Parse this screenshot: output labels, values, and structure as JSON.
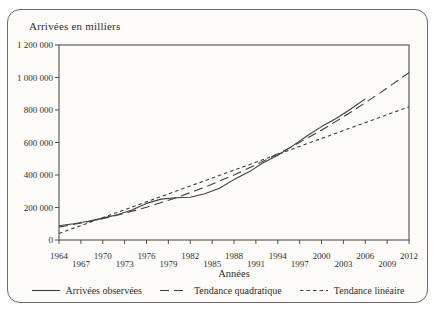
{
  "panel": {
    "title": "Arrivées en milliers"
  },
  "colors": {
    "line": "#3f3f3f",
    "frame": "#4f4f4f",
    "text": "#2f2f2f",
    "panel_border": "#6b6b6b",
    "panel_bg": "#fdfcf9"
  },
  "chart_data": {
    "type": "line",
    "title": "Arrivées en milliers",
    "xlabel": "Années",
    "ylabel": "",
    "xlim": [
      1964,
      2012
    ],
    "ylim": [
      0,
      1200000
    ],
    "grid": false,
    "legend_position": "bottom",
    "x_ticks": [
      1964,
      1967,
      1970,
      1973,
      1976,
      1979,
      1982,
      1985,
      1988,
      1991,
      1994,
      1997,
      2000,
      2003,
      2006,
      2009,
      2012
    ],
    "y_ticks": [
      0,
      200000,
      400000,
      600000,
      800000,
      1000000,
      1200000
    ],
    "y_tick_labels": [
      "0",
      "200 000",
      "400 000",
      "600 000",
      "800 000",
      "1 000 000",
      "1 200 000"
    ],
    "series": [
      {
        "name": "Arrivées observées",
        "style": "solid",
        "x": [
          1964,
          1966,
          1968,
          1970,
          1972,
          1974,
          1976,
          1978,
          1980,
          1982,
          1984,
          1986,
          1988,
          1990,
          1992,
          1994,
          1996,
          1998,
          2000,
          2002,
          2004,
          2006
        ],
        "y": [
          88000,
          100000,
          115000,
          135000,
          155000,
          185000,
          225000,
          252000,
          260000,
          263000,
          285000,
          318000,
          372000,
          418000,
          475000,
          522000,
          578000,
          640000,
          698000,
          748000,
          806000,
          868000
        ]
      },
      {
        "name": "Tendance quadratique",
        "style": "dash-long",
        "x": [
          1964,
          1968,
          1972,
          1976,
          1980,
          1984,
          1988,
          1992,
          1996,
          2000,
          2004,
          2008,
          2012
        ],
        "y": [
          80000,
          112000,
          152000,
          201000,
          259000,
          325000,
          400000,
          484000,
          576000,
          676000,
          786000,
          904000,
          1030000
        ]
      },
      {
        "name": "Tendance linéaire",
        "style": "dash-short",
        "x": [
          1964,
          2012
        ],
        "y": [
          40000,
          820000
        ]
      }
    ]
  }
}
